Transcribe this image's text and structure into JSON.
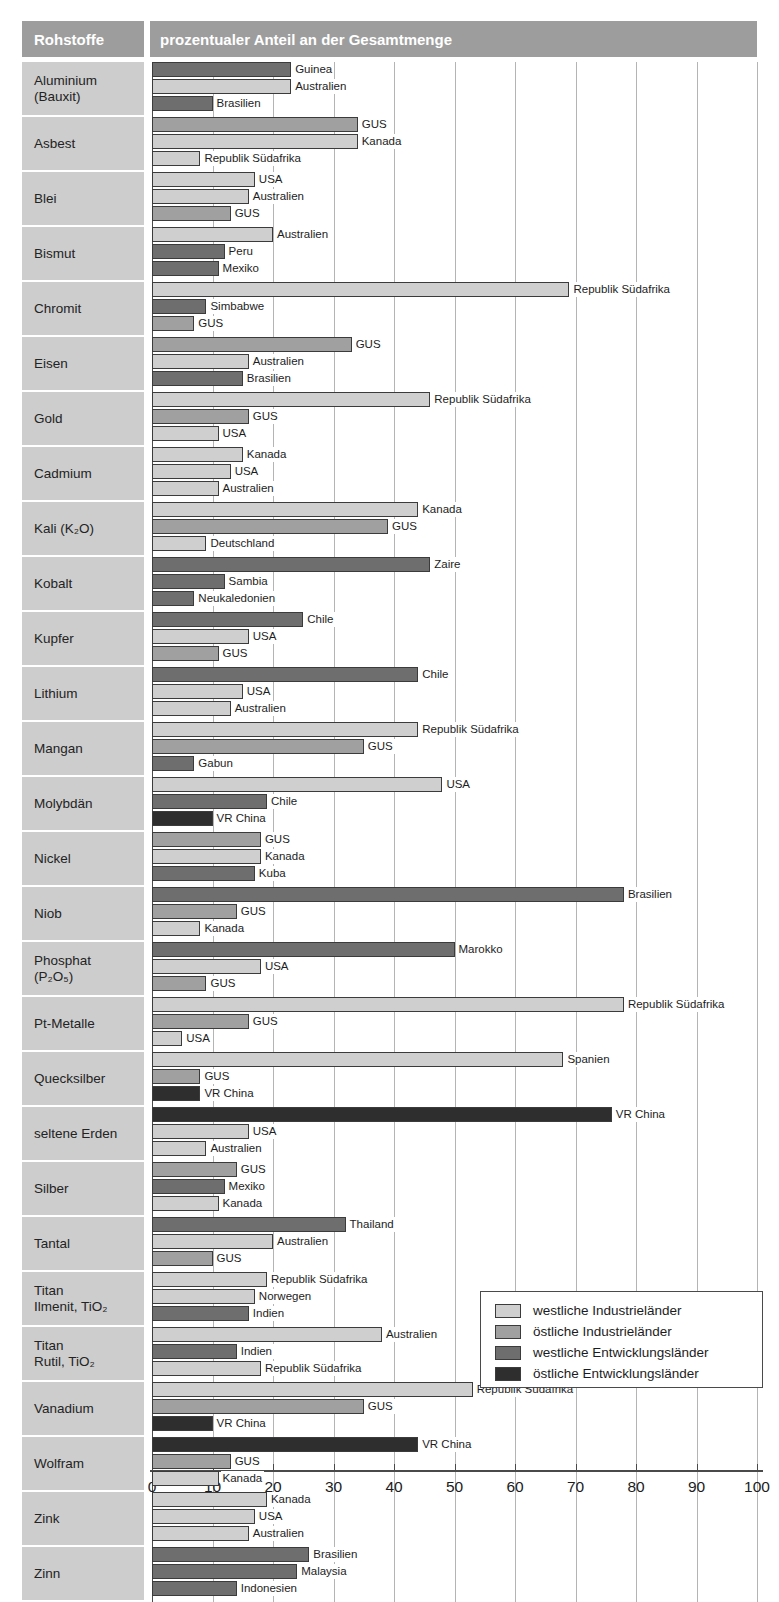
{
  "header": {
    "left_title": "Rohstoffe",
    "right_title": "prozentualer Anteil an der Gesamtmenge"
  },
  "legend": {
    "position": "bottom-right",
    "items": [
      {
        "key": "wi",
        "label": "westliche Industrieländer",
        "color": "#cfcfcf"
      },
      {
        "key": "oi",
        "label": "östliche Industrieländer",
        "color": "#a0a0a0"
      },
      {
        "key": "we",
        "label": "westliche Entwicklungsländer",
        "color": "#6e6e6e"
      },
      {
        "key": "oe",
        "label": "östliche Entwicklungsländer",
        "color": "#2e2e2e"
      }
    ]
  },
  "axis": {
    "ticks": [
      0,
      10,
      20,
      30,
      40,
      50,
      60,
      70,
      80,
      90,
      100
    ],
    "min": 0,
    "max": 100
  },
  "chart_data": {
    "type": "bar",
    "orientation": "horizontal",
    "title": "prozentualer Anteil an der Gesamtmenge",
    "xlabel": "",
    "ylabel": "Rohstoffe",
    "xlim": [
      0,
      100
    ],
    "grid": true,
    "legend_position": "bottom-right",
    "categories": [
      "Aluminium\n(Bauxit)",
      "Asbest",
      "Blei",
      "Bismut",
      "Chromit",
      "Eisen",
      "Gold",
      "Cadmium",
      "Kali (K2O)",
      "Kobalt",
      "Kupfer",
      "Lithium",
      "Mangan",
      "Molybdän",
      "Nickel",
      "Niob",
      "Phosphat\n(P2O5)",
      "Pt-Metalle",
      "Quecksilber",
      "seltene Erden",
      "Silber",
      "Tantal",
      "Titan\nIlmenit, TiO2",
      "Titan\nRutil, TiO2",
      "Vanadium",
      "Wolfram",
      "Zink",
      "Zinn"
    ],
    "groups": [
      {
        "name": "Aluminium (Bauxit)",
        "label_html": "Aluminium\n(Bauxit)",
        "bars": [
          {
            "country": "Guinea",
            "value": 23,
            "class": "we"
          },
          {
            "country": "Australien",
            "value": 23,
            "class": "wi"
          },
          {
            "country": "Brasilien",
            "value": 10,
            "class": "we"
          }
        ]
      },
      {
        "name": "Asbest",
        "label_html": "Asbest",
        "bars": [
          {
            "country": "GUS",
            "value": 34,
            "class": "oi"
          },
          {
            "country": "Kanada",
            "value": 34,
            "class": "wi"
          },
          {
            "country": "Republik Südafrika",
            "value": 8,
            "class": "wi"
          }
        ]
      },
      {
        "name": "Blei",
        "label_html": "Blei",
        "bars": [
          {
            "country": "USA",
            "value": 17,
            "class": "wi"
          },
          {
            "country": "Australien",
            "value": 16,
            "class": "wi"
          },
          {
            "country": "GUS",
            "value": 13,
            "class": "oi"
          }
        ]
      },
      {
        "name": "Bismut",
        "label_html": "Bismut",
        "bars": [
          {
            "country": "Australien",
            "value": 20,
            "class": "wi"
          },
          {
            "country": "Peru",
            "value": 12,
            "class": "we"
          },
          {
            "country": "Mexiko",
            "value": 11,
            "class": "we"
          }
        ]
      },
      {
        "name": "Chromit",
        "label_html": "Chromit",
        "bars": [
          {
            "country": "Republik Südafrika",
            "value": 69,
            "class": "wi"
          },
          {
            "country": "Simbabwe",
            "value": 9,
            "class": "we"
          },
          {
            "country": "GUS",
            "value": 7,
            "class": "oi"
          }
        ]
      },
      {
        "name": "Eisen",
        "label_html": "Eisen",
        "bars": [
          {
            "country": "GUS",
            "value": 33,
            "class": "oi"
          },
          {
            "country": "Australien",
            "value": 16,
            "class": "wi"
          },
          {
            "country": "Brasilien",
            "value": 15,
            "class": "we"
          }
        ]
      },
      {
        "name": "Gold",
        "label_html": "Gold",
        "bars": [
          {
            "country": "Republik Südafrika",
            "value": 46,
            "class": "wi"
          },
          {
            "country": "GUS",
            "value": 16,
            "class": "oi"
          },
          {
            "country": "USA",
            "value": 11,
            "class": "wi"
          }
        ]
      },
      {
        "name": "Cadmium",
        "label_html": "Cadmium",
        "bars": [
          {
            "country": "Kanada",
            "value": 15,
            "class": "wi"
          },
          {
            "country": "USA",
            "value": 13,
            "class": "wi"
          },
          {
            "country": "Australien",
            "value": 11,
            "class": "wi"
          }
        ]
      },
      {
        "name": "Kali (K2O)",
        "label_html": "Kali (K₂O)",
        "bars": [
          {
            "country": "Kanada",
            "value": 44,
            "class": "wi"
          },
          {
            "country": "GUS",
            "value": 39,
            "class": "oi"
          },
          {
            "country": "Deutschland",
            "value": 9,
            "class": "wi"
          }
        ]
      },
      {
        "name": "Kobalt",
        "label_html": "Kobalt",
        "bars": [
          {
            "country": "Zaire",
            "value": 46,
            "class": "we"
          },
          {
            "country": "Sambia",
            "value": 12,
            "class": "we"
          },
          {
            "country": "Neukaledonien",
            "value": 7,
            "class": "we"
          }
        ]
      },
      {
        "name": "Kupfer",
        "label_html": "Kupfer",
        "bars": [
          {
            "country": "Chile",
            "value": 25,
            "class": "we"
          },
          {
            "country": "USA",
            "value": 16,
            "class": "wi"
          },
          {
            "country": "GUS",
            "value": 11,
            "class": "oi"
          }
        ]
      },
      {
        "name": "Lithium",
        "label_html": "Lithium",
        "bars": [
          {
            "country": "Chile",
            "value": 44,
            "class": "we"
          },
          {
            "country": "USA",
            "value": 15,
            "class": "wi"
          },
          {
            "country": "Australien",
            "value": 13,
            "class": "wi"
          }
        ]
      },
      {
        "name": "Mangan",
        "label_html": "Mangan",
        "bars": [
          {
            "country": "Republik Südafrika",
            "value": 44,
            "class": "wi"
          },
          {
            "country": "GUS",
            "value": 35,
            "class": "oi"
          },
          {
            "country": "Gabun",
            "value": 7,
            "class": "we"
          }
        ]
      },
      {
        "name": "Molybdän",
        "label_html": "Molybdän",
        "bars": [
          {
            "country": "USA",
            "value": 48,
            "class": "wi"
          },
          {
            "country": "Chile",
            "value": 19,
            "class": "we"
          },
          {
            "country": "VR China",
            "value": 10,
            "class": "oe"
          }
        ]
      },
      {
        "name": "Nickel",
        "label_html": "Nickel",
        "bars": [
          {
            "country": "GUS",
            "value": 18,
            "class": "oi"
          },
          {
            "country": "Kanada",
            "value": 18,
            "class": "wi"
          },
          {
            "country": "Kuba",
            "value": 17,
            "class": "we"
          }
        ]
      },
      {
        "name": "Niob",
        "label_html": "Niob",
        "bars": [
          {
            "country": "Brasilien",
            "value": 78,
            "class": "we"
          },
          {
            "country": "GUS",
            "value": 14,
            "class": "oi"
          },
          {
            "country": "Kanada",
            "value": 8,
            "class": "wi"
          }
        ]
      },
      {
        "name": "Phosphat (P2O5)",
        "label_html": "Phosphat\n(P₂O₅)",
        "bars": [
          {
            "country": "Marokko",
            "value": 50,
            "class": "we"
          },
          {
            "country": "USA",
            "value": 18,
            "class": "wi"
          },
          {
            "country": "GUS",
            "value": 9,
            "class": "oi"
          }
        ]
      },
      {
        "name": "Pt-Metalle",
        "label_html": "Pt-Metalle",
        "bars": [
          {
            "country": "Republik Südafrika",
            "value": 78,
            "class": "wi"
          },
          {
            "country": "GUS",
            "value": 16,
            "class": "oi"
          },
          {
            "country": "USA",
            "value": 5,
            "class": "wi"
          }
        ]
      },
      {
        "name": "Quecksilber",
        "label_html": "Quecksilber",
        "bars": [
          {
            "country": "Spanien",
            "value": 68,
            "class": "wi"
          },
          {
            "country": "GUS",
            "value": 8,
            "class": "oi"
          },
          {
            "country": "VR China",
            "value": 8,
            "class": "oe"
          }
        ]
      },
      {
        "name": "seltene Erden",
        "label_html": "seltene Erden",
        "bars": [
          {
            "country": "VR China",
            "value": 76,
            "class": "oe"
          },
          {
            "country": "USA",
            "value": 16,
            "class": "wi"
          },
          {
            "country": "Australien",
            "value": 9,
            "class": "wi"
          }
        ]
      },
      {
        "name": "Silber",
        "label_html": "Silber",
        "bars": [
          {
            "country": "GUS",
            "value": 14,
            "class": "oi"
          },
          {
            "country": "Mexiko",
            "value": 12,
            "class": "we"
          },
          {
            "country": "Kanada",
            "value": 11,
            "class": "wi"
          }
        ]
      },
      {
        "name": "Tantal",
        "label_html": "Tantal",
        "bars": [
          {
            "country": "Thailand",
            "value": 32,
            "class": "we"
          },
          {
            "country": "Australien",
            "value": 20,
            "class": "wi"
          },
          {
            "country": "GUS",
            "value": 10,
            "class": "oi"
          }
        ]
      },
      {
        "name": "Titan Ilmenit, TiO2",
        "label_html": "Titan\nIlmenit, TiO₂",
        "bars": [
          {
            "country": "Republik Südafrika",
            "value": 19,
            "class": "wi"
          },
          {
            "country": "Norwegen",
            "value": 17,
            "class": "wi"
          },
          {
            "country": "Indien",
            "value": 16,
            "class": "we"
          }
        ]
      },
      {
        "name": "Titan Rutil, TiO2",
        "label_html": "Titan\nRutil, TiO₂",
        "bars": [
          {
            "country": "Australien",
            "value": 38,
            "class": "wi"
          },
          {
            "country": "Indien",
            "value": 14,
            "class": "we"
          },
          {
            "country": "Republik Südafrika",
            "value": 18,
            "class": "wi"
          }
        ]
      },
      {
        "name": "Vanadium",
        "label_html": "Vanadium",
        "bars": [
          {
            "country": "Republik Südafrika",
            "value": 53,
            "class": "wi"
          },
          {
            "country": "GUS",
            "value": 35,
            "class": "oi"
          },
          {
            "country": "VR China",
            "value": 10,
            "class": "oe"
          }
        ]
      },
      {
        "name": "Wolfram",
        "label_html": "Wolfram",
        "bars": [
          {
            "country": "VR China",
            "value": 44,
            "class": "oe"
          },
          {
            "country": "GUS",
            "value": 13,
            "class": "oi"
          },
          {
            "country": "Kanada",
            "value": 11,
            "class": "wi"
          }
        ]
      },
      {
        "name": "Zink",
        "label_html": "Zink",
        "bars": [
          {
            "country": "Kanada",
            "value": 19,
            "class": "wi"
          },
          {
            "country": "USA",
            "value": 17,
            "class": "wi"
          },
          {
            "country": "Australien",
            "value": 16,
            "class": "wi"
          }
        ]
      },
      {
        "name": "Zinn",
        "label_html": "Zinn",
        "bars": [
          {
            "country": "Brasilien",
            "value": 26,
            "class": "we"
          },
          {
            "country": "Malaysia",
            "value": 24,
            "class": "we"
          },
          {
            "country": "Indonesien",
            "value": 14,
            "class": "we"
          }
        ]
      }
    ]
  }
}
